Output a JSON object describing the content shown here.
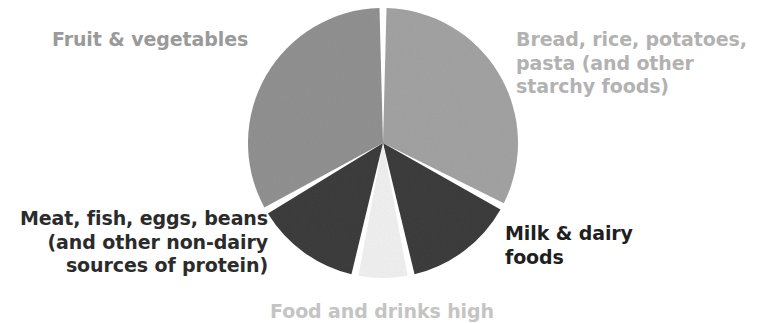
{
  "figure": {
    "background_color": "#ffffff",
    "width": 763,
    "height": 323
  },
  "labels": {
    "fruit_vegetables": "Fruit & vegetables",
    "bread_rice": "Bread, rice, potatoes,\npasta (and other\nstarchy foods)",
    "meat_fish": "Meat, fish, eggs, beans\n(and other non-dairy\nsources of protein)",
    "milk_dairy": "Milk & dairy\nfoods",
    "food_drinks_high": "Food and drinks high"
  },
  "chart_data": {
    "type": "pie",
    "title": "",
    "legend_position": "outside-labels",
    "grid": false,
    "start_angle_deg": 0,
    "direction": "clockwise",
    "center": {
      "x": 383,
      "y": 143
    },
    "radius": 135,
    "gap_deg": 3,
    "categories": [
      "Bread, rice, potatoes, pasta (and other starchy foods)",
      "Milk & dairy foods",
      "Food and drinks high in fat and/or sugar",
      "Meat, fish, eggs, beans (and other non-dairy sources of protein)",
      "Fruit & vegetables"
    ],
    "values": [
      33,
      14,
      7,
      13,
      33
    ],
    "slices": [
      {
        "name": "Bread, rice, potatoes, pasta (and other starchy foods)",
        "value": 33,
        "percent": 33,
        "color": "#a3a3a3",
        "start_deg": 0,
        "end_deg": 118,
        "label_color": "#b2b2b2"
      },
      {
        "name": "Milk & dairy foods",
        "value": 14,
        "percent": 14,
        "color": "#3d3d3d",
        "start_deg": 118,
        "end_deg": 168,
        "label_color": "#1f1f1f"
      },
      {
        "name": "Food and drinks high in fat and/or sugar",
        "value": 7,
        "percent": 7,
        "color": "#f0f0f0",
        "start_deg": 168,
        "end_deg": 192,
        "label_color": "#c4c4c4"
      },
      {
        "name": "Meat, fish, eggs, beans (and other non-dairy sources of protein)",
        "value": 13,
        "percent": 13,
        "color": "#3d3d3d",
        "start_deg": 192,
        "end_deg": 240,
        "label_color": "#2b2b2b"
      },
      {
        "name": "Fruit & vegetables",
        "value": 33,
        "percent": 33,
        "color": "#919191",
        "start_deg": 240,
        "end_deg": 360,
        "label_color": "#9a9a9a"
      }
    ],
    "xlabel": "",
    "ylabel": ""
  },
  "colors": {
    "slice_bread": "#a3a3a3",
    "slice_fruit": "#919191",
    "slice_dark": "#3d3d3d",
    "slice_pale": "#f0f0f0",
    "background": "#ffffff"
  }
}
